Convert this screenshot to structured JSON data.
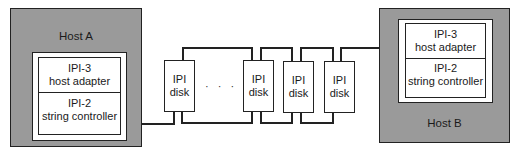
{
  "diagram": {
    "host_a": {
      "label": "Host A",
      "adapter": {
        "line1": "IPI-3",
        "line2": "host adapter"
      },
      "controller": {
        "line1": "IPI-2",
        "line2": "string controller"
      }
    },
    "host_b": {
      "label": "Host B",
      "adapter": {
        "line1": "IPI-3",
        "line2": "host adapter"
      },
      "controller": {
        "line1": "IPI-2",
        "line2": "string controller"
      }
    },
    "disks": [
      {
        "line1": "IPI",
        "line2": "disk"
      },
      {
        "line1": "IPI",
        "line2": "disk"
      },
      {
        "line1": "IPI",
        "line2": "disk"
      },
      {
        "line1": "IPI",
        "line2": "disk"
      }
    ],
    "ellipsis": "· · · ·",
    "colors": {
      "host_fill": "#9a9a9a",
      "line": "#222222",
      "box_fill": "#ffffff"
    }
  }
}
